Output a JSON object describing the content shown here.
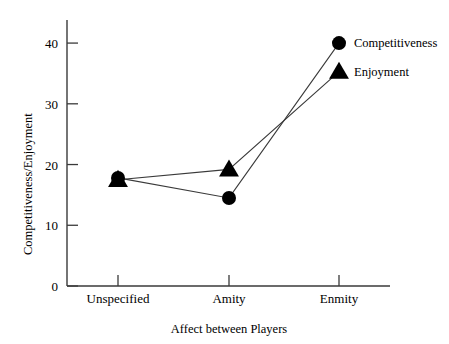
{
  "chart_data": {
    "type": "line",
    "title": "",
    "xlabel": "Affect between Players",
    "ylabel": "Competitiveness/Enjoyment",
    "categories": [
      "Unspecified",
      "Amity",
      "Enmity"
    ],
    "ylim": [
      0,
      43.8
    ],
    "yticks": [
      0,
      10,
      20,
      30,
      40
    ],
    "ytick_labels": [
      "0",
      "10",
      "20",
      "30",
      "40"
    ],
    "grid": false,
    "legend_position": "top-right",
    "marker_color": "#000000",
    "line_color": "#3a3a3a",
    "background_color": "#ffffff",
    "series": [
      {
        "name": "Competitiveness",
        "marker": "circle",
        "values": [
          17.8,
          14.5,
          40.0
        ]
      },
      {
        "name": "Enjoyment",
        "marker": "triangle",
        "values": [
          17.5,
          19.2,
          35.3
        ]
      }
    ]
  },
  "legend": {
    "entries": [
      {
        "label": "Competitiveness",
        "marker": "circle"
      },
      {
        "label": "Enjoyment",
        "marker": "triangle"
      }
    ]
  }
}
